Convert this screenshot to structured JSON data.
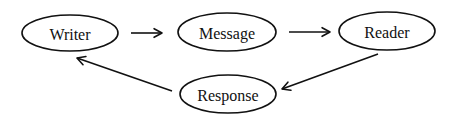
{
  "diagram": {
    "type": "cycle-flow",
    "colors": {
      "stroke": "#111111",
      "text": "#111111",
      "background": "#ffffff"
    },
    "nodes": [
      {
        "id": "writer",
        "label": "Writer",
        "shape": "ellipse",
        "cx": 70,
        "cy": 33,
        "rx": 48,
        "ry": 18
      },
      {
        "id": "message",
        "label": "Message",
        "shape": "ellipse",
        "cx": 227,
        "cy": 32,
        "rx": 49,
        "ry": 19
      },
      {
        "id": "reader",
        "label": "Reader",
        "shape": "ellipse",
        "cx": 387,
        "cy": 31,
        "rx": 48,
        "ry": 19
      },
      {
        "id": "response",
        "label": "Response",
        "shape": "ellipse",
        "cx": 228,
        "cy": 94,
        "rx": 48,
        "ry": 19
      }
    ],
    "edges": [
      {
        "from": "writer",
        "to": "message",
        "x1": 131,
        "y1": 33,
        "x2": 162,
        "y2": 33
      },
      {
        "from": "message",
        "to": "reader",
        "x1": 289,
        "y1": 32,
        "x2": 330,
        "y2": 32
      },
      {
        "from": "reader",
        "to": "response",
        "x1": 378,
        "y1": 54,
        "x2": 282,
        "y2": 89
      },
      {
        "from": "response",
        "to": "writer",
        "x1": 172,
        "y1": 91,
        "x2": 77,
        "y2": 58
      }
    ]
  }
}
